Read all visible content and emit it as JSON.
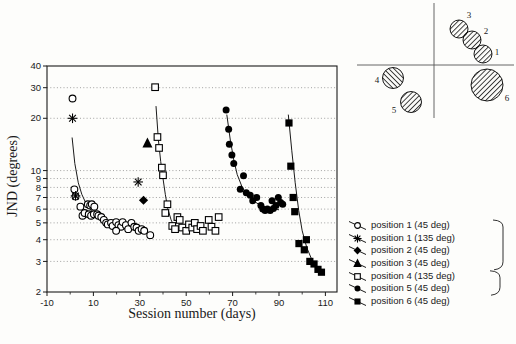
{
  "chart_data": {
    "type": "scatter",
    "title": "",
    "xlabel": "Session number (days)",
    "ylabel": "JND  (degrees)",
    "x_scale": "linear",
    "y_scale": "log",
    "xlim": [
      -10,
      115
    ],
    "ylim": [
      2,
      40
    ],
    "x_ticks": [
      -10,
      10,
      30,
      50,
      70,
      90,
      110
    ],
    "x_minor_ticks": [
      0,
      20,
      40,
      60,
      80,
      100
    ],
    "y_ticks": [
      40,
      30,
      20,
      10,
      9,
      8,
      7,
      6,
      5,
      4,
      3,
      2
    ],
    "grid_y_dotted": [
      30,
      20,
      10,
      9,
      8,
      7,
      6,
      5,
      4,
      3
    ],
    "grid_style": "horizontal dotted",
    "legend_position": "bottom-right outside",
    "series": [
      {
        "name": "position 1 (45 deg)",
        "marker": "open-circle",
        "points": [
          [
            1,
            26
          ],
          [
            1.8,
            7.8
          ],
          [
            2.3,
            7.1
          ],
          [
            4.4,
            6.2
          ],
          [
            5.3,
            5.5
          ],
          [
            6.2,
            5.7
          ],
          [
            7.6,
            6.4
          ],
          [
            8.6,
            6.3
          ],
          [
            9.3,
            6.4
          ],
          [
            10.4,
            6.2
          ],
          [
            8,
            5.6
          ],
          [
            9,
            5.5
          ],
          [
            10.2,
            5.6
          ],
          [
            11.6,
            5.6
          ],
          [
            12.2,
            5.5
          ],
          [
            13.4,
            5.4
          ],
          [
            14.5,
            5.2
          ],
          [
            15.5,
            5.0
          ],
          [
            16.2,
            4.9
          ],
          [
            17.6,
            5.0
          ],
          [
            18.3,
            4.8
          ],
          [
            19.8,
            5.05
          ],
          [
            20.8,
            4.85
          ],
          [
            21.9,
            4.75
          ],
          [
            22.6,
            5.05
          ],
          [
            24,
            4.85
          ],
          [
            25,
            4.6
          ],
          [
            19.8,
            4.5
          ],
          [
            26.4,
            5.0
          ],
          [
            27.6,
            4.75
          ],
          [
            28.6,
            4.7
          ],
          [
            29.5,
            4.5
          ],
          [
            30.8,
            4.6
          ],
          [
            31.9,
            4.5
          ],
          [
            34.5,
            4.25
          ]
        ]
      },
      {
        "name": "position 1 (135 deg)",
        "marker": "asterisk",
        "points": [
          [
            1,
            20
          ],
          [
            2.3,
            7.15
          ],
          [
            29.3,
            8.6
          ]
        ]
      },
      {
        "name": "position 2 (45 deg)",
        "marker": "filled-diamond",
        "points": [
          [
            31.6,
            6.75
          ]
        ]
      },
      {
        "name": "position 3 (45 deg)",
        "marker": "filled-triangle",
        "points": [
          [
            33.3,
            14.3
          ]
        ]
      },
      {
        "name": "position 4 (135 deg)",
        "marker": "open-square",
        "points": [
          [
            36.6,
            30.2
          ],
          [
            37.6,
            15.6
          ],
          [
            38.3,
            13.5
          ],
          [
            39.5,
            10.4
          ],
          [
            40,
            9.4
          ],
          [
            41,
            5.7
          ],
          [
            41.9,
            6.4
          ],
          [
            44,
            4.8
          ],
          [
            45.2,
            4.6
          ],
          [
            46.2,
            5.4
          ],
          [
            47.2,
            5.2
          ],
          [
            48.3,
            4.7
          ],
          [
            50,
            4.5
          ],
          [
            51.2,
            4.9
          ],
          [
            52.6,
            4.7
          ],
          [
            53.7,
            5.0
          ],
          [
            54.7,
            4.6
          ],
          [
            56.2,
            4.8
          ],
          [
            57.2,
            4.5
          ],
          [
            59.7,
            5.2
          ],
          [
            60.9,
            4.75
          ],
          [
            62.6,
            4.5
          ],
          [
            64,
            5.4
          ]
        ]
      },
      {
        "name": "position 5 (45 deg)",
        "marker": "filled-circle",
        "points": [
          [
            67.2,
            22.3
          ],
          [
            68.3,
            17.3
          ],
          [
            68.6,
            14.2
          ],
          [
            69.7,
            12.3
          ],
          [
            70.5,
            11.0
          ],
          [
            74.7,
            9.35
          ],
          [
            73.3,
            7.8
          ],
          [
            75.9,
            7.45
          ],
          [
            77.6,
            7.2
          ],
          [
            78.7,
            6.7
          ],
          [
            80.4,
            7.0
          ],
          [
            82.2,
            6.3
          ],
          [
            83,
            6.0
          ],
          [
            84,
            5.9
          ],
          [
            85,
            6.0
          ],
          [
            86.2,
            5.9
          ],
          [
            87.6,
            6.05
          ],
          [
            88.7,
            6.3
          ],
          [
            87,
            6.7
          ],
          [
            89.7,
            7.0
          ],
          [
            90.7,
            6.55
          ],
          [
            91.6,
            6.4
          ]
        ]
      },
      {
        "name": "position 6 (45 deg)",
        "marker": "filled-square",
        "points": [
          [
            94.3,
            18.8
          ],
          [
            95.1,
            10.6
          ],
          [
            96.1,
            7.0
          ],
          [
            96.8,
            5.8
          ],
          [
            98.6,
            3.8
          ],
          [
            101.8,
            4.0
          ],
          [
            100.9,
            3.5
          ],
          [
            103.3,
            3.0
          ],
          [
            105.1,
            2.9
          ],
          [
            106.8,
            2.7
          ],
          [
            108.3,
            2.6
          ]
        ]
      }
    ],
    "fit_curves": [
      {
        "series": "position 1 (45 deg)",
        "points": [
          [
            0.8,
            15.5
          ],
          [
            2,
            11
          ],
          [
            3.5,
            8.5
          ],
          [
            5,
            7.3
          ],
          [
            7,
            6.4
          ],
          [
            9,
            5.9
          ],
          [
            11,
            5.6
          ],
          [
            13,
            5.4
          ]
        ]
      },
      {
        "series": "position 4 (135 deg)",
        "points": [
          [
            37,
            23.5
          ],
          [
            38,
            15
          ],
          [
            39,
            11.3
          ],
          [
            40,
            9
          ],
          [
            41,
            7.3
          ],
          [
            42,
            6.1
          ],
          [
            43.5,
            5.2
          ],
          [
            45,
            4.7
          ]
        ]
      },
      {
        "series": "position 5 (45 deg)",
        "points": [
          [
            67.5,
            21
          ],
          [
            69,
            15
          ],
          [
            70.5,
            11.5
          ],
          [
            72,
            9.5
          ],
          [
            74,
            8.1
          ],
          [
            76,
            7.3
          ],
          [
            79,
            6.7
          ],
          [
            82,
            6.3
          ],
          [
            85,
            6.1
          ],
          [
            88,
            6.0
          ],
          [
            90,
            5.95
          ]
        ]
      },
      {
        "series": "position 6 (45 deg)",
        "points": [
          [
            94,
            21
          ],
          [
            95.5,
            13
          ],
          [
            97,
            8.5
          ],
          [
            98.5,
            5.9
          ],
          [
            100,
            4.5
          ],
          [
            102,
            3.6
          ],
          [
            104,
            3.1
          ],
          [
            106,
            2.8
          ],
          [
            108,
            2.6
          ]
        ]
      }
    ]
  },
  "axis_titles": {
    "x": "Session number (days)",
    "y": "JND  (degrees)"
  },
  "legend": {
    "items": [
      {
        "marker": "open-circle",
        "label": "position 1 (45 deg)"
      },
      {
        "marker": "asterisk",
        "label": "position 1 (135 deg)"
      },
      {
        "marker": "filled-diamond",
        "label": "position 2 (45 deg)"
      },
      {
        "marker": "filled-triangle",
        "label": "position 3 (45 deg)"
      },
      {
        "marker": "open-square",
        "label": "position 4 (135 deg)"
      },
      {
        "marker": "filled-circle",
        "label": "position 5 (45 deg)"
      },
      {
        "marker": "filled-square",
        "label": "position 6 (45 deg)"
      }
    ],
    "bracket_groups": [
      {
        "from": 0,
        "to": 3
      },
      {
        "from": 4,
        "to": 5
      }
    ]
  },
  "inset": {
    "description": "stimulus position diagram with hatched circles on crossed axes",
    "axes": {
      "vline_x": 434,
      "vline_y1": 3,
      "vline_y2": 118,
      "hline_y": 65,
      "hline_x1": 357,
      "hline_x2": 514
    },
    "circles": [
      {
        "label": "3",
        "cx": 459,
        "cy": 29,
        "r": 9,
        "hatch": "45",
        "lx": 469,
        "ly": 18
      },
      {
        "label": "2",
        "cx": 472,
        "cy": 40,
        "r": 9,
        "hatch": "45",
        "lx": 486,
        "ly": 34
      },
      {
        "label": "1",
        "cx": 483,
        "cy": 54,
        "r": 9,
        "hatch": "45",
        "lx": 497,
        "ly": 55
      },
      {
        "label": "4",
        "cx": 393,
        "cy": 78,
        "r": 10.5,
        "hatch": "135",
        "lx": 377,
        "ly": 83
      },
      {
        "label": "5",
        "cx": 411,
        "cy": 102,
        "r": 10.5,
        "hatch": "45",
        "lx": 394,
        "ly": 113
      },
      {
        "label": "6",
        "cx": 487,
        "cy": 85,
        "r": 16,
        "hatch": "45",
        "lx": 507,
        "ly": 101
      }
    ]
  }
}
